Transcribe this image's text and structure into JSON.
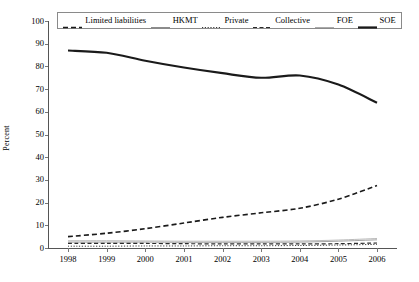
{
  "chart_data": {
    "type": "line",
    "title": "",
    "xlabel": "",
    "ylabel": "Percent",
    "x": [
      1998,
      1999,
      2000,
      2001,
      2002,
      2003,
      2004,
      2005,
      2006
    ],
    "xticklabels": [
      "1998",
      "1999",
      "2000",
      "2001",
      "2002",
      "2003",
      "2004",
      "2005",
      "2006"
    ],
    "yticklabels": [
      "0",
      "10",
      "20",
      "30",
      "40",
      "50",
      "60",
      "70",
      "80",
      "90",
      "100"
    ],
    "ylim": [
      0,
      100
    ],
    "ytick_step": 10,
    "grid": false,
    "legend_position": "top-inside",
    "series": [
      {
        "name": "Limited liabilities",
        "style": "dashed",
        "width": 1.6,
        "color": "#1a1a1a",
        "values": [
          5.0,
          6.5,
          8.5,
          11.0,
          13.5,
          15.5,
          17.5,
          21.5,
          27.5
        ]
      },
      {
        "name": "HKMT",
        "style": "solid",
        "width": 0.8,
        "color": "#8c8c8c",
        "values": [
          2.6,
          2.6,
          2.6,
          2.5,
          2.5,
          2.5,
          2.6,
          3.0,
          3.6
        ]
      },
      {
        "name": "Private",
        "style": "dotted",
        "width": 1.0,
        "color": "#3a3a3a",
        "values": [
          0.8,
          0.8,
          0.9,
          0.9,
          1.0,
          1.0,
          1.1,
          1.3,
          1.6
        ]
      },
      {
        "name": "Collective",
        "style": "dashed",
        "width": 1.2,
        "color": "#2b2b2b",
        "values": [
          2.0,
          2.0,
          2.0,
          1.9,
          1.8,
          1.8,
          1.8,
          1.9,
          2.2
        ]
      },
      {
        "name": "FOE",
        "style": "solid",
        "width": 0.8,
        "color": "#aaaaaa",
        "values": [
          3.2,
          3.2,
          3.1,
          3.0,
          3.0,
          3.0,
          3.1,
          3.5,
          4.2
        ]
      },
      {
        "name": "SOE",
        "style": "solid",
        "width": 2.2,
        "color": "#1a1a1a",
        "values": [
          87.0,
          86.0,
          82.5,
          79.5,
          77.0,
          75.0,
          76.0,
          72.0,
          64.0
        ]
      }
    ]
  },
  "legend": {
    "items": [
      {
        "label": "Limited liabilities",
        "sample": "dashed-thick"
      },
      {
        "label": "HKMT",
        "sample": "solid-thin"
      },
      {
        "label": "Private",
        "sample": "dotted"
      },
      {
        "label": "Collective",
        "sample": "dashed-medium"
      },
      {
        "label": "FOE",
        "sample": "solid-thin"
      },
      {
        "label": "SOE",
        "sample": "solid-thick"
      }
    ]
  }
}
